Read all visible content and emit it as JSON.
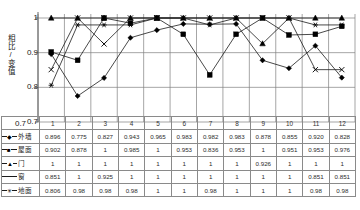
{
  "chart_data": {
    "type": "line",
    "title": "",
    "xlabel": "",
    "ylabel": "相比/变值",
    "ylim": [
      0.7,
      1.0
    ],
    "yticks": [
      "1",
      "0.9",
      "0.8",
      "0.7"
    ],
    "ytick_values": [
      1,
      0.9,
      0.8,
      0.7
    ],
    "grid": true,
    "legend_position": "table-row-labels",
    "categories": [
      "1",
      "2",
      "3",
      "4",
      "5",
      "6",
      "7",
      "8",
      "9",
      "10",
      "11",
      "12"
    ],
    "series": [
      {
        "name": "外墙",
        "marker": "diamond",
        "marker_glyph": "◆",
        "values": [
          0.896,
          0.775,
          0.827,
          0.943,
          0.965,
          0.983,
          0.982,
          0.983,
          0.878,
          0.855,
          0.92,
          0.828
        ],
        "labels": [
          "0.896",
          "0.775",
          "0.827",
          "0.943",
          "0.965",
          "0.983",
          "0.982",
          "0.983",
          "0.878",
          "0.855",
          "0.920",
          "0.828"
        ]
      },
      {
        "name": "屋面",
        "marker": "square",
        "marker_glyph": "■",
        "values": [
          0.902,
          0.878,
          1,
          0.985,
          1,
          0.953,
          0.836,
          0.953,
          1,
          0.951,
          0.953,
          0.976
        ],
        "labels": [
          "0.902",
          "0.878",
          "1",
          "0.985",
          "1",
          "0.953",
          "0.836",
          "0.953",
          "1",
          "0.951",
          "0.953",
          "0.976"
        ]
      },
      {
        "name": "门",
        "marker": "triangle",
        "marker_glyph": "▲",
        "values": [
          1,
          1,
          1,
          1,
          1,
          1,
          1,
          1,
          0.926,
          1,
          1,
          1
        ],
        "labels": [
          "1",
          "1",
          "1",
          "1",
          "1",
          "1",
          "1",
          "1",
          "0.926",
          "1",
          "1",
          "1"
        ]
      },
      {
        "name": "窗",
        "marker": "cross",
        "marker_glyph": "✕",
        "values": [
          0.851,
          1,
          0.925,
          1,
          1,
          1,
          1,
          1,
          1,
          1,
          0.851,
          0.851
        ],
        "labels": [
          "0.851",
          "1",
          "0.925",
          "1",
          "1",
          "1",
          "1",
          "1",
          "1",
          "1",
          "0.851",
          "0.851"
        ]
      },
      {
        "name": "地面",
        "marker": "asterisk",
        "marker_glyph": "✳",
        "values": [
          0.806,
          0.98,
          0.98,
          0.98,
          1,
          1,
          0.98,
          1,
          1,
          1,
          0.98,
          0.98
        ],
        "labels": [
          "0.806",
          "0.98",
          "0.98",
          "0.98",
          "1",
          "1",
          "0.98",
          "1",
          "1",
          "1",
          "0.98",
          "0.98"
        ]
      }
    ]
  },
  "table": {
    "corner_label": "0.7",
    "column_headers": [
      "1",
      "2",
      "3",
      "4",
      "5",
      "6",
      "7",
      "8",
      "9",
      "10",
      "11",
      "12"
    ]
  },
  "colors": {
    "line": "#1a1a1a",
    "grid": "#808080",
    "axis": "#555555",
    "table_border": "#8a8a8a",
    "text": "#1f1f1f"
  }
}
